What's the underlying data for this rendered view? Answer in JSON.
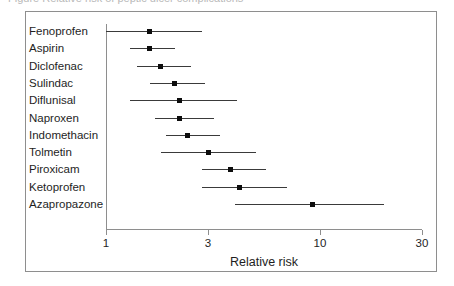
{
  "caption_sliver": {
    "text": "Figure  Relative risk of peptic ulcer complications"
  },
  "colors": {
    "marker": "#0d0d0d",
    "ci_line": "#3a3a3a",
    "axis": "#8e8e8e",
    "frame": "#8e8e8e",
    "background": "#ffffff",
    "text": "#1e1e1e"
  },
  "chart_data": {
    "type": "scatter",
    "subtype": "forest-plot",
    "title": "",
    "subtitle": "",
    "xlabel": "Relative risk",
    "ylabel": "",
    "xscale": "log",
    "xlim": [
      1,
      30
    ],
    "xticks": [
      1,
      3,
      10,
      30
    ],
    "xtick_labels": [
      "1",
      "3",
      "10",
      "30"
    ],
    "grid": false,
    "legend": null,
    "reference_line": {
      "x": 1,
      "label": "no effect"
    },
    "marker_style": "filled-square",
    "categories": [
      "Fenoprofen",
      "Aspirin",
      "Diclofenac",
      "Sulindac",
      "Diflunisal",
      "Naproxen",
      "Indomethacin",
      "Tolmetin",
      "Piroxicam",
      "Ketoprofen",
      "Azapropazone"
    ],
    "points": [
      {
        "label": "Fenoprofen",
        "value": 1.6,
        "ci_low": 1.0,
        "ci_high": 2.8
      },
      {
        "label": "Aspirin",
        "value": 1.6,
        "ci_low": 1.3,
        "ci_high": 2.1
      },
      {
        "label": "Diclofenac",
        "value": 1.8,
        "ci_low": 1.4,
        "ci_high": 2.5
      },
      {
        "label": "Sulindac",
        "value": 2.1,
        "ci_low": 1.6,
        "ci_high": 2.9
      },
      {
        "label": "Diflunisal",
        "value": 2.2,
        "ci_low": 1.3,
        "ci_high": 4.1
      },
      {
        "label": "Naproxen",
        "value": 2.2,
        "ci_low": 1.7,
        "ci_high": 3.2
      },
      {
        "label": "Indomethacin",
        "value": 2.4,
        "ci_low": 1.9,
        "ci_high": 3.4
      },
      {
        "label": "Tolmetin",
        "value": 3.0,
        "ci_low": 1.8,
        "ci_high": 5.0
      },
      {
        "label": "Piroxicam",
        "value": 3.8,
        "ci_low": 2.8,
        "ci_high": 5.6
      },
      {
        "label": "Ketoprofen",
        "value": 4.2,
        "ci_low": 2.8,
        "ci_high": 7.0
      },
      {
        "label": "Azapropazone",
        "value": 9.2,
        "ci_low": 4.0,
        "ci_high": 20.0
      }
    ],
    "series": [
      {
        "name": "Relative risk",
        "values": [
          1.6,
          1.6,
          1.8,
          2.1,
          2.2,
          2.2,
          2.4,
          3.0,
          3.8,
          4.2,
          9.2
        ]
      }
    ]
  },
  "geometry": {
    "plot_left_px": 80,
    "plot_right_px": 396,
    "x1_px": 80,
    "x30_px": 396,
    "row_top_px": 19,
    "row_step_px": 17.3,
    "axis_y_px": 217
  }
}
